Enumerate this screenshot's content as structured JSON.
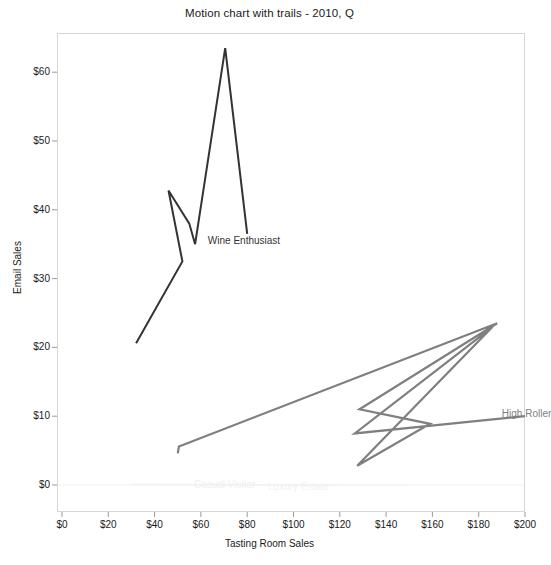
{
  "chart_data": {
    "type": "line",
    "title": "Motion chart with trails - 2010, Q",
    "xlabel": "Tasting Room Sales",
    "ylabel": "Email Sales",
    "xlim": [
      0,
      210
    ],
    "ylim": [
      -2,
      64
    ],
    "xticks": [
      "$0",
      "$20",
      "$40",
      "$60",
      "$80",
      "$100",
      "$120",
      "$140",
      "$160",
      "$180",
      "$200"
    ],
    "xtick_values": [
      0,
      20,
      40,
      60,
      80,
      100,
      120,
      140,
      160,
      180,
      200
    ],
    "yticks": [
      "$0",
      "$10",
      "$20",
      "$30",
      "$40",
      "$50",
      "$60"
    ],
    "ytick_values": [
      0,
      10,
      20,
      30,
      40,
      50,
      60
    ],
    "grid": false,
    "legend_position": "inline-trail-end-labels",
    "series": [
      {
        "name": "Wine Enthusiast",
        "color": "#333333",
        "label_x": 63,
        "label_y": 35.5,
        "points": [
          [
            32.0,
            20.6
          ],
          [
            52.0,
            32.5
          ],
          [
            46.0,
            42.8
          ],
          [
            55.0,
            38.0
          ],
          [
            57.5,
            35.0
          ],
          [
            70.5,
            63.5
          ],
          [
            80.0,
            36.5
          ]
        ]
      },
      {
        "name": "High Roller",
        "color": "#7f7f7f",
        "label_x": 190,
        "label_y": 10.3,
        "points": [
          [
            50.0,
            4.6
          ],
          [
            50.5,
            5.6
          ],
          [
            188.0,
            23.5
          ],
          [
            128.5,
            11.0
          ],
          [
            159.0,
            8.9
          ],
          [
            127.5,
            2.8
          ],
          [
            186.0,
            23.0
          ],
          [
            126.5,
            7.5
          ],
          [
            200.0,
            10.0
          ]
        ]
      },
      {
        "name": "Casual Visitor",
        "color": "#f0f0f0",
        "label_x": 57,
        "label_y": 0.0,
        "points": [
          [
            30.0,
            0.1
          ],
          [
            120.0,
            0.05
          ]
        ]
      },
      {
        "name": "Luxury Estate",
        "color": "#f2f2f2",
        "label_x": 89,
        "label_y": -0.35,
        "points": [
          [
            85.0,
            0.0
          ],
          [
            150.0,
            0.0
          ]
        ]
      }
    ]
  },
  "axes_geometry": {
    "plot_left": 57,
    "plot_top": 33,
    "plot_width": 468,
    "plot_height": 479,
    "x_zero_px": 62,
    "x_scale_px_per_dollar": 2.315,
    "y_zero_px": 485,
    "y_scale_px_per_dollar": 6.88
  }
}
